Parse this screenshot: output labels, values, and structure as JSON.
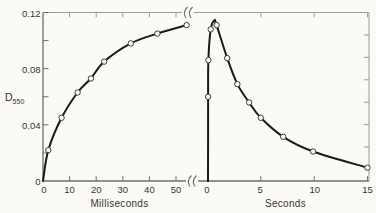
{
  "chart_data": {
    "type": "line",
    "title": "",
    "ylabel": "D550",
    "ylabel_base": "D",
    "ylabel_subscript": "550",
    "ylim": [
      0,
      0.12
    ],
    "y_ticks": [
      0.02,
      0.04,
      0.06,
      0.08,
      0.1,
      0.12
    ],
    "y_tick_labels": [
      "0",
      "0.04",
      "0.08",
      "0.12"
    ],
    "y_tick_label_values": [
      0,
      0.04,
      0.08,
      0.12
    ],
    "grid": false,
    "legend": false,
    "axis_break_between_panels": true,
    "panels": [
      {
        "name": "rise-phase",
        "xlabel": "Milliseconds",
        "xlim": [
          0,
          55
        ],
        "x_ticks": [
          0,
          10,
          20,
          30,
          40,
          50
        ],
        "x_tick_labels": [
          "0",
          "10",
          "20",
          "30",
          "40",
          "50"
        ],
        "series": [
          {
            "name": "D550-rise",
            "curve_x": [
              0,
              2,
              7,
              13,
              18,
              23,
              33,
              43,
              54
            ],
            "curve_y": [
              0,
              0.022,
              0.045,
              0.063,
              0.073,
              0.085,
              0.098,
              0.105,
              0.111
            ],
            "marker_x": [
              2,
              7,
              13,
              18,
              23,
              33,
              43,
              54
            ],
            "marker_y": [
              0.022,
              0.045,
              0.063,
              0.073,
              0.085,
              0.098,
              0.105,
              0.111
            ]
          }
        ]
      },
      {
        "name": "decay-phase",
        "xlabel": "Seconds",
        "xlim": [
          0,
          15
        ],
        "x_ticks": [
          0,
          5,
          10,
          15
        ],
        "x_tick_labels": [
          "0",
          "5",
          "10",
          "15"
        ],
        "series": [
          {
            "name": "D550-decay",
            "curve_x": [
              0.05,
              0.06,
              0.08,
              0.3,
              0.65,
              0.85,
              1.85,
              2.8,
              3.9,
              5.0,
              7.1,
              9.9,
              15
            ],
            "curve_y": [
              0,
              0.06,
              0.086,
              0.108,
              0.1145,
              0.111,
              0.0875,
              0.069,
              0.056,
              0.045,
              0.0315,
              0.021,
              0.0095
            ],
            "marker_x": [
              0.06,
              0.08,
              0.3,
              0.85,
              1.85,
              2.8,
              3.9,
              5.0,
              7.1,
              9.9,
              15
            ],
            "marker_y": [
              0.06,
              0.086,
              0.108,
              0.111,
              0.0875,
              0.069,
              0.056,
              0.045,
              0.0315,
              0.021,
              0.0095
            ]
          }
        ]
      }
    ],
    "colors": {
      "curve": "#1a1a1a",
      "marker_fill": "#fcfbf8",
      "marker_stroke": "#3c3c3c",
      "axis": "#6f6f6f",
      "border": "#9b9b9b",
      "text": "#343434",
      "background": "#fbfaf7"
    }
  }
}
